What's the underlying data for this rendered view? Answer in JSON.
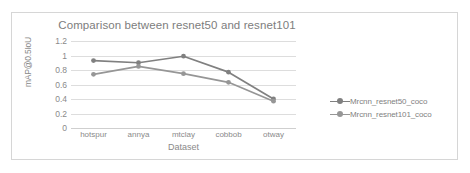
{
  "chart_data": {
    "type": "line",
    "title": "Comparison between resnet50 and resnet101",
    "xlabel": "Dataset",
    "ylabel": "mAP@0.5IoU",
    "categories": [
      "hotspur",
      "annya",
      "mtclay",
      "cobbob",
      "otway"
    ],
    "ylim": [
      0,
      1.2
    ],
    "yticks": [
      "1.2",
      "1",
      "0.8",
      "0.6",
      "0.4",
      "0.2",
      "0"
    ],
    "ytick_values": [
      1.2,
      1,
      0.8,
      0.6,
      0.4,
      0.2,
      0
    ],
    "grid": true,
    "legend_position": "right",
    "series": [
      {
        "name": "Mrcnn_resnet50_coco",
        "color": "#808080",
        "values": [
          0.93,
          0.9,
          0.99,
          0.77,
          0.4
        ]
      },
      {
        "name": "Mrcnn_resnet101_coco",
        "color": "#969696",
        "values": [
          0.74,
          0.85,
          0.75,
          0.63,
          0.37
        ]
      }
    ]
  },
  "colors": {
    "frame_border": "#d6d6d6",
    "gridline": "#dddddd",
    "axis_text": "#8a8a8a",
    "title_text": "#7d7d7d",
    "legend_text": "#7f7f7f",
    "background": "#ffffff"
  }
}
